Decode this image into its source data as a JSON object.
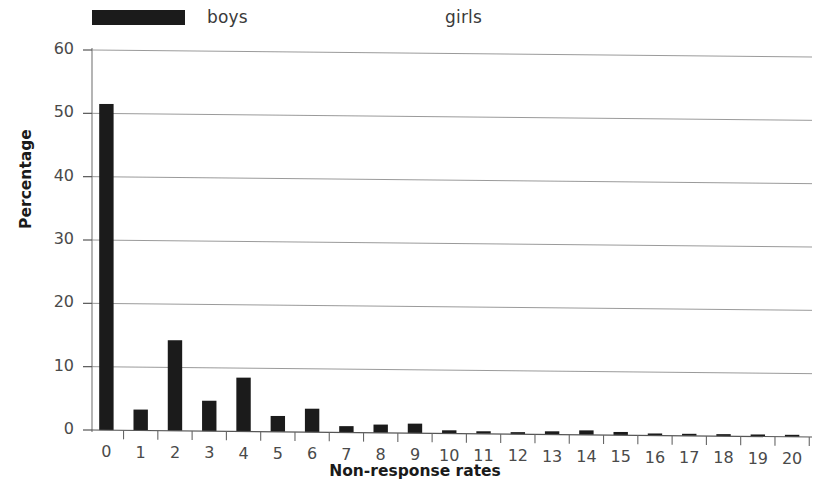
{
  "legend": {
    "entries": [
      {
        "label": "boys",
        "color": "#1b1b1b",
        "swatch": "filled-black-swatch"
      },
      {
        "label": "girls",
        "color": "#ffffff",
        "swatch": "filled-white-swatch"
      }
    ]
  },
  "axes": {
    "y_title": "Percentage",
    "x_title": "Non-response rates"
  },
  "chart_data": {
    "type": "bar",
    "title": "",
    "subtitle": "",
    "xlabel": "Non-response rates",
    "ylabel": "Percentage",
    "categories": [
      "0",
      "1",
      "2",
      "3",
      "4",
      "5",
      "6",
      "7",
      "8",
      "9",
      "10",
      "11",
      "12",
      "13",
      "14",
      "15",
      "16",
      "17",
      "18",
      "19",
      "20"
    ],
    "ylim": [
      0,
      60
    ],
    "yticks": [
      0,
      10,
      20,
      30,
      40,
      50,
      60
    ],
    "ytick_labels": [
      "0",
      "10",
      "20",
      "30",
      "40",
      "50",
      "60"
    ],
    "grid": "horizontal",
    "legend_position": "top-left",
    "series": [
      {
        "name": "boys",
        "color": "#1b1b1b",
        "values": [
          51.5,
          3.3,
          14.3,
          4.8,
          8.5,
          2.5,
          3.7,
          1.0,
          1.3,
          1.5,
          0.5,
          0.4,
          0.15,
          0.5,
          0.7,
          0.5,
          0.2,
          0.1,
          0.05,
          0.05,
          0.15
        ]
      },
      {
        "name": "girls",
        "color": "#ffffff",
        "values": [
          0,
          0,
          0,
          0,
          0,
          0,
          0,
          0,
          0,
          0,
          0,
          0,
          0,
          0,
          0,
          0,
          0,
          0,
          0,
          0,
          0
        ]
      }
    ]
  }
}
